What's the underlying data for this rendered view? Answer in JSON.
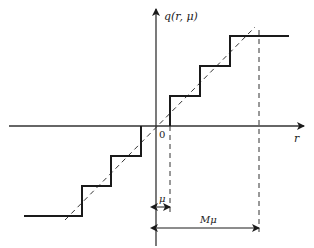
{
  "diagram": {
    "axes": {
      "x_label": "r",
      "y_label": "q(r, μ)",
      "origin_label": "0"
    },
    "annotations": {
      "step_width_label": "μ",
      "range_label": "Mμ"
    },
    "colors": {
      "line": "#1a1a1a",
      "axis": "#333333",
      "dashed": "#333333",
      "background": "#ffffff"
    }
  }
}
